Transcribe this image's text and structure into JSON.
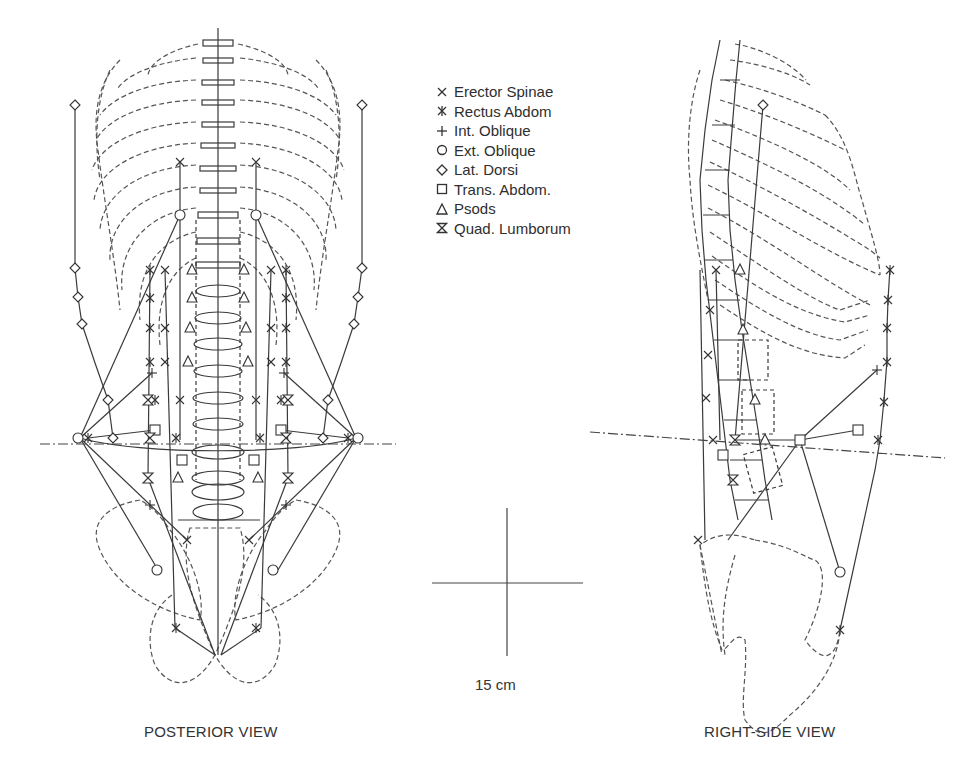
{
  "legend": {
    "items": [
      {
        "symbol": "x-mark",
        "label": "Erector Spinae"
      },
      {
        "symbol": "asterisk",
        "label": "Rectus Abdom"
      },
      {
        "symbol": "plus",
        "label": "Int. Oblique"
      },
      {
        "symbol": "circle",
        "label": "Ext. Oblique"
      },
      {
        "symbol": "diamond",
        "label": "Lat. Dorsi"
      },
      {
        "symbol": "square",
        "label": "Trans. Abdom."
      },
      {
        "symbol": "triangle",
        "label": "Psods"
      },
      {
        "symbol": "hourglass",
        "label": "Quad. Lumborum"
      }
    ]
  },
  "scale_bar": {
    "label": "15 cm"
  },
  "views": {
    "posterior": {
      "caption": "POSTERIOR VIEW"
    },
    "right_side": {
      "caption": "RIGHT-SIDE VIEW"
    }
  },
  "colors": {
    "line": "#3a3a3a",
    "background": "#ffffff"
  }
}
